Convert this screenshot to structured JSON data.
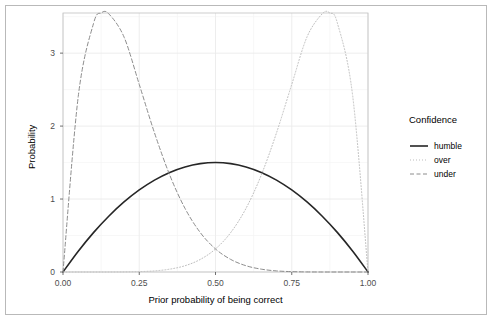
{
  "chart_data": {
    "type": "line",
    "title": "",
    "xlabel": "Prior probability of being correct",
    "ylabel": "Probability",
    "xlim": [
      0.0,
      1.0
    ],
    "ylim": [
      0.0,
      3.55
    ],
    "xticks": [
      "0.00",
      "0.25",
      "0.50",
      "0.75",
      "1.00"
    ],
    "xtick_values": [
      0.0,
      0.25,
      0.5,
      0.75,
      1.0
    ],
    "yticks": [
      "0",
      "1",
      "2",
      "3"
    ],
    "ytick_values": [
      0,
      1,
      2,
      3
    ],
    "grid": true,
    "legend_position": "right",
    "legend_title": "Confidence",
    "series": [
      {
        "name": "humble",
        "style": "solid",
        "color": "#262626",
        "x": [
          0.0,
          0.05,
          0.1,
          0.15,
          0.2,
          0.25,
          0.3,
          0.35,
          0.4,
          0.45,
          0.5,
          0.55,
          0.6,
          0.65,
          0.7,
          0.75,
          0.8,
          0.85,
          0.9,
          0.95,
          1.0
        ],
        "values": [
          0.0,
          0.285,
          0.54,
          0.765,
          0.96,
          1.125,
          1.26,
          1.365,
          1.44,
          1.485,
          1.5,
          1.485,
          1.44,
          1.365,
          1.26,
          1.125,
          0.96,
          0.765,
          0.54,
          0.285,
          0.0
        ]
      },
      {
        "name": "over",
        "style": "dotted",
        "color": "#bdbdbd",
        "x": [
          0.0,
          0.05,
          0.1,
          0.15,
          0.2,
          0.25,
          0.3,
          0.35,
          0.4,
          0.45,
          0.5,
          0.55,
          0.6,
          0.65,
          0.7,
          0.75,
          0.8,
          0.85,
          0.875,
          0.9,
          0.95,
          1.0
        ],
        "values": [
          0.0,
          0.0,
          0.0,
          0.0,
          0.001,
          0.005,
          0.015,
          0.039,
          0.086,
          0.172,
          0.316,
          0.541,
          0.872,
          1.328,
          1.907,
          2.571,
          3.222,
          3.539,
          3.551,
          3.406,
          2.407,
          0.0
        ]
      },
      {
        "name": "under",
        "style": "dashed",
        "color": "#8c8c8c",
        "x": [
          0.0,
          0.05,
          0.1,
          0.125,
          0.15,
          0.2,
          0.25,
          0.3,
          0.35,
          0.4,
          0.45,
          0.5,
          0.55,
          0.6,
          0.65,
          0.7,
          0.75,
          0.8,
          0.85,
          0.9,
          0.95,
          1.0
        ],
        "values": [
          0.0,
          2.407,
          3.406,
          3.551,
          3.539,
          3.222,
          2.571,
          1.907,
          1.328,
          0.872,
          0.541,
          0.316,
          0.172,
          0.086,
          0.039,
          0.015,
          0.005,
          0.001,
          0.0,
          0.0,
          0.0,
          0.0
        ]
      }
    ]
  },
  "legend": {
    "title": "Confidence",
    "items": [
      {
        "label": "humble",
        "style": "solid"
      },
      {
        "label": "over",
        "style": "dotted"
      },
      {
        "label": "under",
        "style": "dashed"
      }
    ]
  },
  "axes": {
    "x_title": "Prior probability of being correct",
    "y_title": "Probability",
    "x_tick_labels": [
      "0.00",
      "0.25",
      "0.50",
      "0.75",
      "1.00"
    ],
    "y_tick_labels": [
      "0",
      "1",
      "2",
      "3"
    ]
  },
  "colors": {
    "humble": "#262626",
    "over": "#bdbdbd",
    "under": "#8c8c8c",
    "grid_major": "#ebebeb",
    "grid_minor": "#f4f4f4",
    "panel_border": "#c0c0c0",
    "figure_border": "#b9b9b9",
    "panel_bg": "#ffffff",
    "text": "#000000",
    "tick_text": "#4d4d4d"
  }
}
